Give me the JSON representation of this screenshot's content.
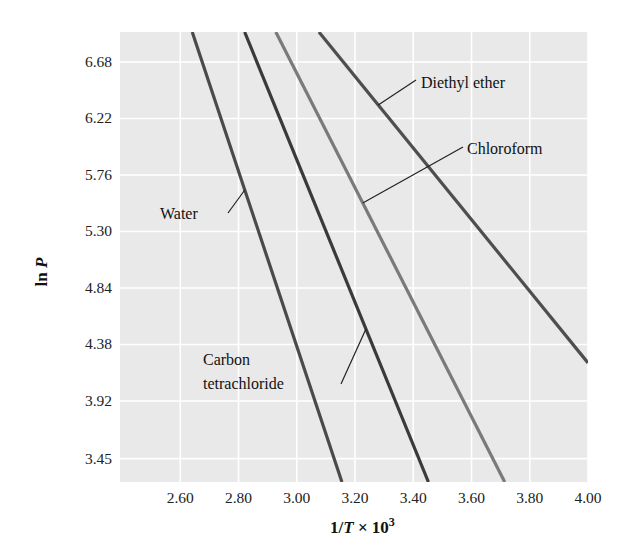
{
  "chart_data": {
    "type": "line",
    "title": "",
    "xlabel": "1/T × 10³",
    "xlabel_parts": {
      "base": "1/",
      "italic": "T",
      "times": " × 10",
      "sup": "3"
    },
    "ylabel": "ln P",
    "ylabel_parts": {
      "plain": "ln ",
      "italic": "P"
    },
    "xlim": [
      2.393,
      4.0
    ],
    "ylim": [
      3.26,
      6.924
    ],
    "x_ticks": [
      2.6,
      2.8,
      3.0,
      3.2,
      3.4,
      3.6,
      3.8,
      4.0
    ],
    "x_tick_labels": [
      "2.60",
      "2.80",
      "3.00",
      "3.20",
      "3.40",
      "3.60",
      "3.80",
      "4.00"
    ],
    "y_ticks": [
      3.45,
      3.92,
      4.38,
      4.84,
      5.3,
      5.76,
      6.22,
      6.68
    ],
    "y_tick_labels": [
      "3.45",
      "3.92",
      "4.38",
      "4.84",
      "5.30",
      "5.76",
      "6.22",
      "6.68"
    ],
    "grid": true,
    "legend": "inline callout labels",
    "series": [
      {
        "name": "Water",
        "color": "#4a4a4a",
        "points": [
          [
            2.641,
            6.924
          ],
          [
            3.155,
            3.26
          ]
        ]
      },
      {
        "name": "Carbon tetrachloride",
        "color": "#3a3a3a",
        "points": [
          [
            2.821,
            6.924
          ],
          [
            3.452,
            3.26
          ]
        ]
      },
      {
        "name": "Chloroform",
        "color": "#7a7a7a",
        "points": [
          [
            2.928,
            6.924
          ],
          [
            3.714,
            3.26
          ]
        ]
      },
      {
        "name": "Diethyl ether",
        "color": "#4e4e4e",
        "points": [
          [
            3.076,
            6.924
          ],
          [
            4.0,
            4.23
          ]
        ]
      }
    ],
    "annotations": [
      {
        "text": "Water",
        "anchor_series": "Water"
      },
      {
        "text": "Carbon tetrachloride",
        "lines": [
          "Carbon",
          "tetrachloride"
        ],
        "anchor_series": "Carbon tetrachloride"
      },
      {
        "text": "Chloroform",
        "anchor_series": "Chloroform"
      },
      {
        "text": "Diethyl ether",
        "anchor_series": "Diethyl ether"
      }
    ]
  },
  "style": {
    "plot_bg": "#e9e9e9",
    "grid_color": "#ffffff",
    "leader_color": "#222222"
  },
  "labels": {
    "water": "Water",
    "ccl4_line1": "Carbon",
    "ccl4_line2": "tetrachloride",
    "chloroform": "Chloroform",
    "diethyl": "Diethyl ether"
  }
}
